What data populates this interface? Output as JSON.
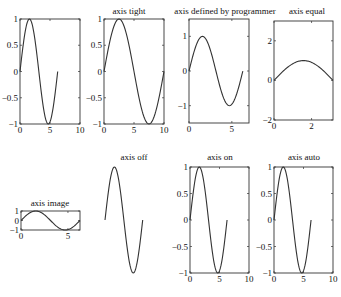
{
  "chart_data": [
    {
      "type": "line",
      "id": "plot-default",
      "title": "",
      "series": [
        {
          "name": "sin(x)",
          "x_range": [
            0,
            6.283
          ],
          "function": "sin"
        }
      ],
      "xlim": [
        0,
        10
      ],
      "ylim": [
        -1,
        1
      ],
      "xticks": [
        0,
        5,
        10
      ],
      "yticks": [
        -1,
        -0.5,
        0,
        0.5,
        1
      ],
      "xticklabels": [
        "0",
        "5",
        "10"
      ],
      "yticklabels": [
        "−1",
        "−0.5",
        "0",
        "0.5",
        "1"
      ],
      "axis_visible": true,
      "box": [
        20,
        19,
        80,
        124
      ]
    },
    {
      "type": "line",
      "id": "plot-axis-tight",
      "title": "axis tight",
      "series": [
        {
          "name": "sin(x)",
          "x_range": [
            0,
            10
          ],
          "function": "sin_scaled"
        }
      ],
      "xlim": [
        0,
        10
      ],
      "ylim": [
        -1,
        1
      ],
      "xticks": [
        0,
        5,
        10
      ],
      "yticks": [
        -1,
        -0.5,
        0,
        0.5,
        1
      ],
      "xticklabels": [
        "0",
        "5",
        "10"
      ],
      "yticklabels": [
        "−1",
        "−0.5",
        "0",
        "0.5",
        "1"
      ],
      "axis_visible": true,
      "box": [
        104,
        19,
        164,
        124
      ]
    },
    {
      "type": "line",
      "id": "plot-axis-defined",
      "title": "axis defined by programmer",
      "series": [
        {
          "name": "sin(x)",
          "x_range": [
            0,
            6.283
          ],
          "function": "sin"
        }
      ],
      "xlim": [
        0,
        7
      ],
      "ylim": [
        -1.5,
        1.5
      ],
      "xticks": [
        0,
        5
      ],
      "yticks": [
        -1,
        0,
        1
      ],
      "xticklabels": [
        "0",
        "5"
      ],
      "yticklabels": [
        "−1",
        "0",
        "1"
      ],
      "axis_visible": true,
      "box": [
        189,
        19,
        249,
        123
      ]
    },
    {
      "type": "line",
      "id": "plot-axis-equal",
      "title": "axis equal",
      "series": [
        {
          "name": "sin(x)",
          "x_range": [
            0,
            3.1416
          ],
          "function": "sin"
        }
      ],
      "xlim": [
        0,
        3.1416
      ],
      "ylim": [
        -2,
        3
      ],
      "xticks": [
        0,
        2
      ],
      "yticks": [
        -2,
        0,
        2
      ],
      "xticklabels": [
        "0",
        "2"
      ],
      "yticklabels": [
        "−2",
        "0",
        "2"
      ],
      "axis_visible": true,
      "box": [
        274,
        21,
        333,
        120
      ]
    },
    {
      "type": "line",
      "id": "plot-axis-image",
      "title": "axis image",
      "series": [
        {
          "name": "sin(x)",
          "x_range": [
            0,
            6.283
          ],
          "function": "sin"
        }
      ],
      "xlim": [
        0,
        6.283
      ],
      "ylim": [
        -1,
        1
      ],
      "xticks": [
        0,
        5
      ],
      "yticks": [
        -1,
        0,
        1
      ],
      "xticklabels": [
        "0",
        "5"
      ],
      "yticklabels": [
        "−1",
        "0",
        "1"
      ],
      "axis_visible": true,
      "box": [
        21,
        211,
        80,
        230
      ]
    },
    {
      "type": "line",
      "id": "plot-axis-off",
      "title": "axis off",
      "series": [
        {
          "name": "sin(x)",
          "x_range": [
            0,
            6.283
          ],
          "function": "sin"
        }
      ],
      "xlim": [
        0,
        10
      ],
      "ylim": [
        -1,
        1
      ],
      "xticks": [],
      "yticks": [],
      "xticklabels": [],
      "yticklabels": [],
      "axis_visible": false,
      "box": [
        105,
        167,
        165,
        273
      ]
    },
    {
      "type": "line",
      "id": "plot-axis-on",
      "title": "axis on",
      "series": [
        {
          "name": "sin(x)",
          "x_range": [
            0,
            6.283
          ],
          "function": "sin"
        }
      ],
      "xlim": [
        0,
        10
      ],
      "ylim": [
        -1,
        1
      ],
      "xticks": [
        0,
        5,
        10
      ],
      "yticks": [
        -1,
        -0.5,
        0,
        0.5,
        1
      ],
      "xticklabels": [
        "0",
        "5",
        "10"
      ],
      "yticklabels": [
        "−1",
        "−0.5",
        "0",
        "0.5",
        "1"
      ],
      "axis_visible": true,
      "box": [
        190,
        167,
        249,
        273
      ]
    },
    {
      "type": "line",
      "id": "plot-axis-auto",
      "title": "axis auto",
      "series": [
        {
          "name": "sin(x)",
          "x_range": [
            0,
            6.283
          ],
          "function": "sin"
        }
      ],
      "xlim": [
        0,
        10
      ],
      "ylim": [
        -1,
        1
      ],
      "xticks": [
        0,
        5,
        10
      ],
      "yticks": [
        -1,
        -0.5,
        0,
        0.5,
        1
      ],
      "xticklabels": [
        "0",
        "5",
        "10"
      ],
      "yticklabels": [
        "−1",
        "−0.5",
        "0",
        "0.5",
        "1"
      ],
      "axis_visible": true,
      "box": [
        274,
        167,
        333,
        273
      ]
    }
  ],
  "titles": {
    "plot1": "",
    "plot2": "axis tight",
    "plot3": "axis defined by programmer",
    "plot4": "axis equal",
    "plot5": "axis image",
    "plot6": "axis off",
    "plot7": "axis on",
    "plot8": "axis auto"
  },
  "colors": {
    "line": "#333333",
    "axes": "#333333",
    "text": "#111111",
    "background": "#ffffff"
  }
}
